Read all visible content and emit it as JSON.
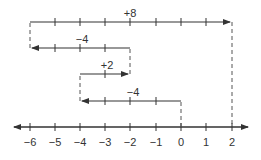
{
  "diagram": {
    "type": "number-line-addition",
    "axis": {
      "ticks": [
        -6,
        -5,
        -4,
        -3,
        -2,
        -1,
        0,
        1,
        2
      ],
      "labels": [
        "−6",
        "−5",
        "−4",
        "−3",
        "−2",
        "−1",
        "0",
        "1",
        "2"
      ]
    },
    "steps": [
      {
        "label": "−4",
        "from": 0,
        "to": -4
      },
      {
        "label": "+2",
        "from": -4,
        "to": -2
      },
      {
        "label": "−4",
        "from": -2,
        "to": -6
      },
      {
        "label": "+8",
        "from": -6,
        "to": 2
      }
    ],
    "result": 2,
    "colors": {
      "line": "#333333",
      "dashed": "#555555"
    }
  }
}
